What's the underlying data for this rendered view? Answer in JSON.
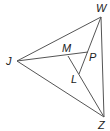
{
  "diagram": {
    "type": "triangle-with-interior-segments",
    "stroke_color": "#555555",
    "label_color": "#222222",
    "vertices": {
      "W": {
        "label": "W",
        "x": 101,
        "y": 17
      },
      "J": {
        "label": "J",
        "x": 17,
        "y": 61
      },
      "Z": {
        "label": "Z",
        "x": 104,
        "y": 117
      },
      "M": {
        "label": "M",
        "x": 68,
        "y": 56
      },
      "P": {
        "label": "P",
        "x": 88,
        "y": 52
      },
      "L": {
        "label": "L",
        "x": 79,
        "y": 74
      }
    },
    "segments": [
      [
        "J",
        "W"
      ],
      [
        "W",
        "Z"
      ],
      [
        "J",
        "Z"
      ],
      [
        "J",
        "P"
      ],
      [
        "M",
        "Z"
      ],
      [
        "W",
        "L"
      ]
    ],
    "labels": {
      "W": "W",
      "J": "J",
      "Z": "Z",
      "M": "M",
      "P": "P",
      "L": "L"
    }
  }
}
